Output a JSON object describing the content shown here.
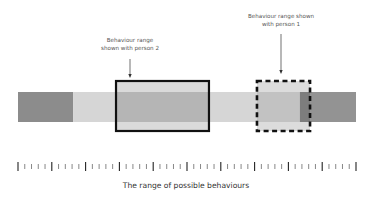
{
  "diagram": {
    "caption": "The range of possible behaviours",
    "annotations": {
      "person2": [
        "Behaviour range",
        "shown with person 2"
      ],
      "person1": [
        "Behaviour range shown",
        "with person 1"
      ]
    },
    "bar": {
      "range_min": 0,
      "range_max": 100,
      "segments": [
        {
          "name": "dark-left",
          "from": 0,
          "to": 16.3,
          "color": "#8c8c8c"
        },
        {
          "name": "light",
          "from": 16.3,
          "to": 29.0,
          "color": "#d6d6d6"
        },
        {
          "name": "mid-person2",
          "from": 29.0,
          "to": 56.5,
          "color": "#b5b5b5"
        },
        {
          "name": "light-2",
          "from": 56.5,
          "to": 70.7,
          "color": "#d6d6d6"
        },
        {
          "name": "mid-person1",
          "from": 70.7,
          "to": 83.4,
          "color": "#c2c2c2"
        },
        {
          "name": "darker-stripe",
          "from": 83.4,
          "to": 86.4,
          "color": "#7d7d7d"
        },
        {
          "name": "dark-right",
          "from": 86.4,
          "to": 100,
          "color": "#939393"
        }
      ]
    },
    "ranges": {
      "person2": {
        "from": 29.0,
        "to": 56.5,
        "style": "solid"
      },
      "person1": {
        "from": 70.7,
        "to": 86.4,
        "style": "dashed"
      }
    },
    "ruler": {
      "tick_count": 51,
      "major_every": 5
    }
  }
}
